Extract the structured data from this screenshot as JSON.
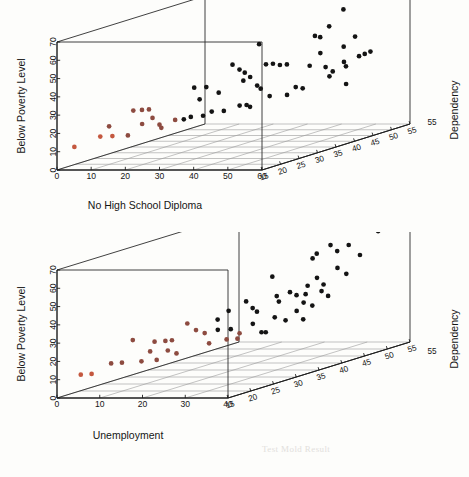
{
  "figure": {
    "background": "#fdfdfb",
    "point_colors": {
      "low": "#c4583f",
      "mid": "#8d4b40",
      "high": "#141414"
    }
  },
  "chart_data": [
    {
      "type": "scatter",
      "panel": "top",
      "title": "",
      "xlabel": "No High School Diploma",
      "ylabel": "Below Poverty Level",
      "zlabel": "Dependency",
      "xlim": [
        0,
        60
      ],
      "ylim": [
        0,
        70
      ],
      "zlim": [
        15,
        55
      ],
      "xticks": [
        0,
        10,
        20,
        30,
        40,
        50,
        60
      ],
      "yticks": [
        0,
        10,
        20,
        30,
        40,
        50,
        60,
        70
      ],
      "zticks": [
        15,
        20,
        25,
        30,
        35,
        40,
        45,
        50,
        55
      ],
      "grid": true,
      "legend": "none",
      "projection": "3d",
      "points": [
        {
          "x": 4.0,
          "y": 12.0,
          "z": 16.0,
          "c": "low"
        },
        {
          "x": 10.5,
          "y": 17.0,
          "z": 17.0,
          "c": "low"
        },
        {
          "x": 13.5,
          "y": 17.0,
          "z": 17.5,
          "c": "low"
        },
        {
          "x": 12.0,
          "y": 22.0,
          "z": 18.0,
          "c": "mid"
        },
        {
          "x": 17.5,
          "y": 17.0,
          "z": 18.0,
          "c": "mid"
        },
        {
          "x": 18.0,
          "y": 30.0,
          "z": 19.0,
          "c": "mid"
        },
        {
          "x": 20.0,
          "y": 30.0,
          "z": 19.5,
          "c": "mid"
        },
        {
          "x": 21.5,
          "y": 30.0,
          "z": 20.0,
          "c": "mid"
        },
        {
          "x": 19.5,
          "y": 22.0,
          "z": 20.0,
          "c": "mid"
        },
        {
          "x": 22.0,
          "y": 25.0,
          "z": 20.5,
          "c": "mid"
        },
        {
          "x": 23.5,
          "y": 21.0,
          "z": 21.0,
          "c": "mid"
        },
        {
          "x": 23.5,
          "y": 19.0,
          "z": 21.5,
          "c": "mid"
        },
        {
          "x": 27.0,
          "y": 23.0,
          "z": 22.0,
          "c": "mid"
        },
        {
          "x": 29.0,
          "y": 23.0,
          "z": 22.5,
          "c": "high"
        },
        {
          "x": 30.5,
          "y": 24.0,
          "z": 23.0,
          "c": "high"
        },
        {
          "x": 31.5,
          "y": 40.0,
          "z": 23.0,
          "c": "high"
        },
        {
          "x": 34.5,
          "y": 40.0,
          "z": 23.5,
          "c": "high"
        },
        {
          "x": 32.0,
          "y": 33.0,
          "z": 24.0,
          "c": "high"
        },
        {
          "x": 33.0,
          "y": 24.0,
          "z": 24.0,
          "c": "high"
        },
        {
          "x": 35.0,
          "y": 26.0,
          "z": 24.5,
          "c": "high"
        },
        {
          "x": 36.5,
          "y": 36.0,
          "z": 25.0,
          "c": "high"
        },
        {
          "x": 38.0,
          "y": 26.0,
          "z": 25.0,
          "c": "high"
        },
        {
          "x": 40.0,
          "y": 51.0,
          "z": 25.5,
          "c": "high"
        },
        {
          "x": 41.5,
          "y": 48.0,
          "z": 26.0,
          "c": "high"
        },
        {
          "x": 42.5,
          "y": 46.0,
          "z": 26.5,
          "c": "high"
        },
        {
          "x": 41.0,
          "y": 28.0,
          "z": 26.5,
          "c": "high"
        },
        {
          "x": 42.5,
          "y": 28.0,
          "z": 27.0,
          "c": "high"
        },
        {
          "x": 43.5,
          "y": 27.0,
          "z": 27.0,
          "c": "high"
        },
        {
          "x": 41.0,
          "y": 41.0,
          "z": 27.5,
          "c": "high"
        },
        {
          "x": 43.0,
          "y": 43.0,
          "z": 27.5,
          "c": "high"
        },
        {
          "x": 44.5,
          "y": 38.0,
          "z": 28.0,
          "c": "high"
        },
        {
          "x": 45.0,
          "y": 36.0,
          "z": 28.5,
          "c": "high"
        },
        {
          "x": 44.0,
          "y": 60.0,
          "z": 29.0,
          "c": "high"
        },
        {
          "x": 46.0,
          "y": 49.0,
          "z": 29.0,
          "c": "high"
        },
        {
          "x": 47.5,
          "y": 49.0,
          "z": 29.5,
          "c": "high"
        },
        {
          "x": 46.0,
          "y": 31.0,
          "z": 30.0,
          "c": "high"
        },
        {
          "x": 49.0,
          "y": 48.0,
          "z": 30.0,
          "c": "high"
        },
        {
          "x": 50.5,
          "y": 48.0,
          "z": 30.5,
          "c": "high"
        },
        {
          "x": 50.0,
          "y": 31.0,
          "z": 31.0,
          "c": "high"
        },
        {
          "x": 52.0,
          "y": 35.0,
          "z": 31.5,
          "c": "high"
        },
        {
          "x": 53.5,
          "y": 34.0,
          "z": 32.0,
          "c": "high"
        },
        {
          "x": 55.0,
          "y": 46.0,
          "z": 32.5,
          "c": "high"
        },
        {
          "x": 56.0,
          "y": 62.0,
          "z": 33.0,
          "c": "high"
        },
        {
          "x": 57.0,
          "y": 61.0,
          "z": 33.5,
          "c": "high"
        },
        {
          "x": 56.5,
          "y": 52.0,
          "z": 34.0,
          "c": "high"
        },
        {
          "x": 57.5,
          "y": 44.0,
          "z": 34.5,
          "c": "high"
        },
        {
          "x": 58.0,
          "y": 66.0,
          "z": 35.0,
          "c": "high"
        },
        {
          "x": 58.5,
          "y": 41.0,
          "z": 35.5,
          "c": "high"
        },
        {
          "x": 57.0,
          "y": 38.0,
          "z": 36.0,
          "c": "high"
        },
        {
          "x": 60.0,
          "y": 74.0,
          "z": 37.0,
          "c": "high"
        },
        {
          "x": 59.0,
          "y": 53.0,
          "z": 38.0,
          "c": "high"
        },
        {
          "x": 58.0,
          "y": 44.0,
          "z": 39.0,
          "c": "high"
        },
        {
          "x": 57.5,
          "y": 41.0,
          "z": 40.0,
          "c": "high"
        },
        {
          "x": 57.0,
          "y": 31.0,
          "z": 40.5,
          "c": "high"
        },
        {
          "x": 58.0,
          "y": 56.0,
          "z": 42.0,
          "c": "high"
        },
        {
          "x": 57.0,
          "y": 44.0,
          "z": 44.0,
          "c": "high"
        },
        {
          "x": 56.5,
          "y": 44.0,
          "z": 46.0,
          "c": "high"
        },
        {
          "x": 56.0,
          "y": 44.0,
          "z": 48.0,
          "c": "high"
        }
      ]
    },
    {
      "type": "scatter",
      "panel": "bottom",
      "title": "",
      "xlabel": "Unemployment",
      "ylabel": "Below Poverty Level",
      "zlabel": "Dependency",
      "xlim": [
        0,
        40
      ],
      "ylim": [
        0,
        70
      ],
      "zlim": [
        15,
        55
      ],
      "xticks": [
        0,
        10,
        20,
        30,
        40
      ],
      "yticks": [
        0,
        10,
        20,
        30,
        40,
        50,
        60,
        70
      ],
      "zticks": [
        15,
        20,
        25,
        30,
        35,
        40,
        45,
        50,
        55
      ],
      "grid": true,
      "legend": "none",
      "projection": "3d",
      "points": [
        {
          "x": 4.5,
          "y": 12.0,
          "z": 16.0,
          "c": "low"
        },
        {
          "x": 6.5,
          "y": 12.0,
          "z": 16.5,
          "c": "low"
        },
        {
          "x": 10.0,
          "y": 17.0,
          "z": 17.5,
          "c": "mid"
        },
        {
          "x": 12.0,
          "y": 17.0,
          "z": 18.0,
          "c": "mid"
        },
        {
          "x": 14.0,
          "y": 29.0,
          "z": 18.5,
          "c": "mid"
        },
        {
          "x": 15.5,
          "y": 17.0,
          "z": 19.0,
          "c": "mid"
        },
        {
          "x": 17.0,
          "y": 22.0,
          "z": 19.5,
          "c": "mid"
        },
        {
          "x": 18.0,
          "y": 17.0,
          "z": 20.0,
          "c": "mid"
        },
        {
          "x": 17.5,
          "y": 27.0,
          "z": 20.0,
          "c": "mid"
        },
        {
          "x": 19.5,
          "y": 27.0,
          "z": 20.5,
          "c": "mid"
        },
        {
          "x": 20.5,
          "y": 27.0,
          "z": 21.0,
          "c": "mid"
        },
        {
          "x": 19.0,
          "y": 21.0,
          "z": 21.5,
          "c": "mid"
        },
        {
          "x": 20.5,
          "y": 19.0,
          "z": 22.0,
          "c": "mid"
        },
        {
          "x": 22.5,
          "y": 35.0,
          "z": 22.5,
          "c": "mid"
        },
        {
          "x": 24.0,
          "y": 31.0,
          "z": 23.0,
          "c": "mid"
        },
        {
          "x": 25.5,
          "y": 29.0,
          "z": 23.5,
          "c": "mid"
        },
        {
          "x": 26.0,
          "y": 23.0,
          "z": 24.0,
          "c": "mid"
        },
        {
          "x": 28.0,
          "y": 36.0,
          "z": 24.0,
          "c": "high"
        },
        {
          "x": 27.5,
          "y": 30.0,
          "z": 24.5,
          "c": "high"
        },
        {
          "x": 29.5,
          "y": 40.0,
          "z": 25.0,
          "c": "high"
        },
        {
          "x": 30.0,
          "y": 30.0,
          "z": 25.0,
          "c": "high"
        },
        {
          "x": 28.5,
          "y": 24.0,
          "z": 25.5,
          "c": "mid"
        },
        {
          "x": 30.5,
          "y": 24.0,
          "z": 26.0,
          "c": "mid"
        },
        {
          "x": 31.0,
          "y": 27.0,
          "z": 26.0,
          "c": "mid"
        },
        {
          "x": 32.0,
          "y": 44.0,
          "z": 26.5,
          "c": "high"
        },
        {
          "x": 33.0,
          "y": 40.0,
          "z": 27.0,
          "c": "high"
        },
        {
          "x": 34.0,
          "y": 38.0,
          "z": 27.0,
          "c": "high"
        },
        {
          "x": 32.5,
          "y": 31.0,
          "z": 27.5,
          "c": "high"
        },
        {
          "x": 34.0,
          "y": 26.0,
          "z": 28.0,
          "c": "high"
        },
        {
          "x": 35.0,
          "y": 26.0,
          "z": 28.0,
          "c": "high"
        },
        {
          "x": 36.0,
          "y": 56.0,
          "z": 28.5,
          "c": "high"
        },
        {
          "x": 36.5,
          "y": 45.0,
          "z": 29.0,
          "c": "high"
        },
        {
          "x": 37.0,
          "y": 42.0,
          "z": 29.0,
          "c": "high"
        },
        {
          "x": 35.5,
          "y": 33.0,
          "z": 29.5,
          "c": "high"
        },
        {
          "x": 37.5,
          "y": 31.0,
          "z": 30.0,
          "c": "high"
        },
        {
          "x": 38.0,
          "y": 46.0,
          "z": 30.5,
          "c": "high"
        },
        {
          "x": 39.0,
          "y": 44.0,
          "z": 31.0,
          "c": "high"
        },
        {
          "x": 38.5,
          "y": 35.0,
          "z": 31.5,
          "c": "high"
        },
        {
          "x": 39.5,
          "y": 30.0,
          "z": 32.0,
          "c": "high"
        },
        {
          "x": 40.0,
          "y": 48.0,
          "z": 32.5,
          "c": "high"
        },
        {
          "x": 39.0,
          "y": 43.0,
          "z": 33.0,
          "c": "high"
        },
        {
          "x": 38.0,
          "y": 38.0,
          "z": 33.5,
          "c": "high"
        },
        {
          "x": 39.5,
          "y": 36.0,
          "z": 34.0,
          "c": "high"
        },
        {
          "x": 40.0,
          "y": 64.0,
          "z": 34.5,
          "c": "high"
        },
        {
          "x": 38.5,
          "y": 61.0,
          "z": 35.0,
          "c": "high"
        },
        {
          "x": 39.0,
          "y": 50.0,
          "z": 35.5,
          "c": "high"
        },
        {
          "x": 40.0,
          "y": 46.0,
          "z": 36.0,
          "c": "high"
        },
        {
          "x": 39.0,
          "y": 42.0,
          "z": 36.5,
          "c": "high"
        },
        {
          "x": 40.0,
          "y": 39.0,
          "z": 37.0,
          "c": "high"
        },
        {
          "x": 39.5,
          "y": 66.0,
          "z": 38.0,
          "c": "high"
        },
        {
          "x": 40.0,
          "y": 62.0,
          "z": 39.0,
          "c": "high"
        },
        {
          "x": 39.0,
          "y": 52.0,
          "z": 40.0,
          "c": "high"
        },
        {
          "x": 40.0,
          "y": 48.0,
          "z": 41.0,
          "c": "high"
        },
        {
          "x": 39.5,
          "y": 63.0,
          "z": 42.0,
          "c": "high"
        },
        {
          "x": 40.0,
          "y": 56.0,
          "z": 44.0,
          "c": "high"
        },
        {
          "x": 40.0,
          "y": 72.0,
          "z": 46.0,
          "c": "high"
        },
        {
          "x": 40.0,
          "y": 66.0,
          "z": 48.0,
          "c": "high"
        }
      ]
    }
  ],
  "bleed_text": {
    "line_a": "Test Mold Result",
    "line_b": "Unemployment"
  }
}
